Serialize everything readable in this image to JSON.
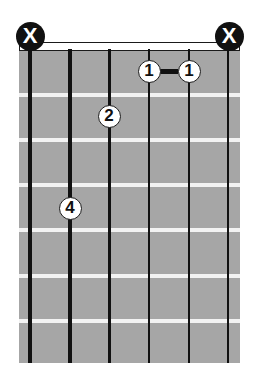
{
  "chord_diagram": {
    "strings": 6,
    "frets_shown": 7,
    "string_x": [
      30,
      70,
      109,
      149,
      189,
      228
    ],
    "string_width": [
      4,
      3.5,
      3,
      2.5,
      2,
      1.5
    ],
    "fret_y": [
      93,
      138,
      183,
      228,
      274,
      319
    ],
    "muted_strings": [
      {
        "string": 6,
        "label": "X",
        "x": 30
      },
      {
        "string": 1,
        "label": "X",
        "x": 229
      }
    ],
    "fingers": [
      {
        "finger": "1",
        "string": 3,
        "fret": 1,
        "x": 149,
        "y": 71
      },
      {
        "finger": "1",
        "string": 2,
        "fret": 1,
        "x": 189,
        "y": 71
      },
      {
        "finger": "2",
        "string": 4,
        "fret": 2,
        "x": 109,
        "y": 116
      },
      {
        "finger": "4",
        "string": 5,
        "fret": 4,
        "x": 70,
        "y": 208
      }
    ],
    "barre": {
      "finger": "1",
      "from_string": 3,
      "to_string": 2,
      "fret": 1
    },
    "colors": {
      "fretboard": "#a6a6a6",
      "fret": "#f2f2f2",
      "string": "#111111",
      "marker_fill": "#ffffff",
      "mute_fill": "#111111"
    }
  }
}
